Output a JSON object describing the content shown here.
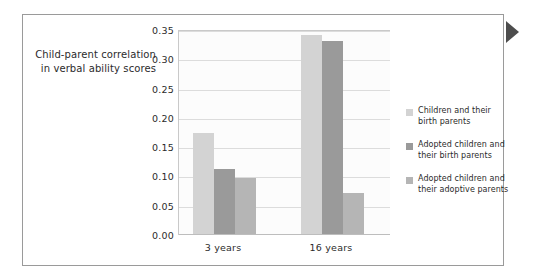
{
  "figure": {
    "page_marker_icon": "right-triangle-marker"
  },
  "axis_title": {
    "line1": "Child-parent correlation",
    "line2": "in verbal ability scores"
  },
  "chart_data": {
    "type": "bar",
    "title": "",
    "subtitle": "",
    "xlabel": "",
    "ylabel": "Child-parent correlation in verbal ability scores",
    "categories": [
      "3 years",
      "16 years"
    ],
    "ylim": [
      0.0,
      0.35
    ],
    "ytick_labels": [
      "0.00",
      "0.05",
      "0.10",
      "0.15",
      "0.20",
      "0.25",
      "0.30",
      "0.35"
    ],
    "ytick_values": [
      0.0,
      0.05,
      0.1,
      0.15,
      0.2,
      0.25,
      0.3,
      0.35
    ],
    "grid": true,
    "legend_position": "right",
    "series": [
      {
        "name": "Children and their birth parents",
        "name_line1": "Children and their",
        "name_line2": "birth parents",
        "color": "#d3d3d3",
        "values": [
          0.175,
          0.341
        ]
      },
      {
        "name": "Adopted children and their birth parents",
        "name_line1": "Adopted children and",
        "name_line2": "their birth parents",
        "color": "#9a9a9a",
        "values": [
          0.112,
          0.331
        ]
      },
      {
        "name": "Adopted children and their adoptive parents",
        "name_line1": "Adopted children and",
        "name_line2": "their adoptive parents",
        "color": "#b5b5b5",
        "values": [
          0.097,
          0.071
        ]
      }
    ]
  }
}
